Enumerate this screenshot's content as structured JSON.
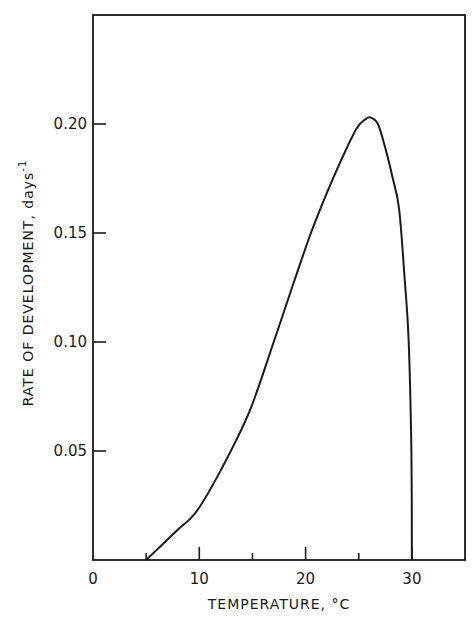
{
  "chart_data": {
    "type": "line",
    "title": "",
    "xlabel": "TEMPERATURE, °C",
    "ylabel": "RATE OF DEVELOPMENT, days",
    "ylabel_superscript": "-1",
    "xlim": [
      0,
      35
    ],
    "ylim": [
      0,
      0.25
    ],
    "x_ticks": [
      0,
      10,
      20,
      30
    ],
    "x_tick_labels": [
      "0",
      "10",
      "20",
      "30"
    ],
    "x_minor_ticks": [
      5,
      15,
      25
    ],
    "y_ticks": [
      0.05,
      0.1,
      0.15,
      0.2
    ],
    "y_tick_labels": [
      "0.05",
      "0.10",
      "0.15",
      "0.20"
    ],
    "grid": false,
    "legend": null,
    "series": [
      {
        "name": "Rate of development",
        "x": [
          5.0,
          6.5,
          8.0,
          9.7,
          12.0,
          14.7,
          17.0,
          19.0,
          20.5,
          21.8,
          23.3,
          24.8,
          25.6,
          26.1,
          26.8,
          27.5,
          28.2,
          28.8,
          29.3,
          29.7,
          29.95,
          30.0
        ],
        "y": [
          0.0,
          0.007,
          0.014,
          0.022,
          0.041,
          0.068,
          0.1,
          0.129,
          0.15,
          0.166,
          0.183,
          0.198,
          0.202,
          0.203,
          0.2,
          0.189,
          0.175,
          0.161,
          0.13,
          0.1,
          0.05,
          0.0
        ]
      }
    ],
    "annotations": []
  },
  "colors": {
    "line": "#1a1a1a",
    "background": "#ffffff"
  }
}
